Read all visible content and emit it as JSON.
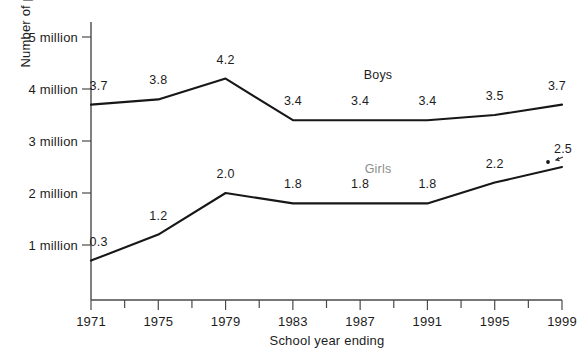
{
  "chart_data": {
    "type": "line",
    "title": "",
    "xlabel": "School year ending",
    "ylabel": "Number of participants",
    "categories": [
      "1971",
      "1975",
      "1979",
      "1983",
      "1987",
      "1991",
      "1995",
      "1999"
    ],
    "x": [
      1971,
      1975,
      1979,
      1983,
      1987,
      1991,
      1995,
      1999
    ],
    "xlim": [
      1971,
      1999
    ],
    "ylim": [
      0,
      5
    ],
    "grid": false,
    "legend_position": "inline-labels",
    "y_tick_values": [
      1,
      2,
      3,
      4,
      5
    ],
    "y_tick_labels": [
      "1 million",
      "2 million",
      "3 million",
      "4 million",
      "5 million"
    ],
    "minor_x_ticks": [
      1973,
      1977,
      1981,
      1985,
      1989,
      1993,
      1997
    ],
    "series": [
      {
        "name": "Boys",
        "values": [
          3.7,
          3.8,
          4.2,
          3.4,
          3.4,
          3.4,
          3.5,
          3.7
        ],
        "labels": [
          "3.7",
          "3.8",
          "4.2",
          "3.4",
          "3.4",
          "3.4",
          "3.5",
          "3.7"
        ],
        "color": "#171717",
        "label_color": "#1d1d1d"
      },
      {
        "name": "Girls",
        "values": [
          0.7,
          1.2,
          2.0,
          1.8,
          1.8,
          1.8,
          2.2,
          2.5
        ],
        "labels": [
          "0.3",
          "1.2",
          "2.0",
          "1.8",
          "1.8",
          "1.8",
          "2.2",
          "2.5"
        ],
        "color": "#171717",
        "label_color": "#1d1d1d"
      }
    ],
    "annotations": [
      {
        "text": "Boys",
        "kind": "series-inline-label",
        "x": 1990,
        "y": 4.05,
        "style": "dark"
      },
      {
        "text": "Girls",
        "kind": "series-inline-label",
        "x": 1990,
        "y": 2.5,
        "style": "faint"
      },
      {
        "text": "2.5",
        "kind": "arrow-callout",
        "note": "small arrow points from the 2.5 label down-left to the final Girls data point"
      }
    ]
  },
  "axis_titles": {
    "x": "School year ending",
    "y": "Number of participants"
  },
  "y_ticks": [
    {
      "label": "5 million",
      "value": 5
    },
    {
      "label": "4 million",
      "value": 4
    },
    {
      "label": "3 million",
      "value": 3
    },
    {
      "label": "2 million",
      "value": 2
    },
    {
      "label": "1 million",
      "value": 1
    }
  ],
  "x_ticks": [
    {
      "label": "1971",
      "value": 1971
    },
    {
      "label": "1975",
      "value": 1975
    },
    {
      "label": "1979",
      "value": 1979
    },
    {
      "label": "1983",
      "value": 1983
    },
    {
      "label": "1987",
      "value": 1987
    },
    {
      "label": "1991",
      "value": 1991
    },
    {
      "label": "1995",
      "value": 1995
    },
    {
      "label": "1999",
      "value": 1999
    }
  ],
  "series_labels": {
    "boys": "Boys",
    "girls": "Girls"
  },
  "boys_point_labels": [
    "3.7",
    "3.8",
    "4.2",
    "3.4",
    "3.4",
    "3.4",
    "3.5",
    "3.7"
  ],
  "girls_point_labels": [
    "0.3",
    "1.2",
    "2.0",
    "1.8",
    "1.8",
    "1.8",
    "2.2",
    "2.5"
  ],
  "colors": {
    "line": "#171717",
    "axis": "#4a4a4a",
    "text": "#1d1d1d",
    "faint_text": "#8d8d8d",
    "background": "#ffffff"
  }
}
